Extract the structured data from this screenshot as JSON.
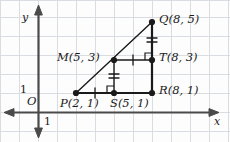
{
  "figure": {
    "colors": {
      "background": "#fdfdfd",
      "grid": "#d9dce0",
      "axis": "#4a4a4a",
      "segment": "#1a1a1a",
      "mark": "#1a1a1a",
      "label": "#1a1a1a"
    },
    "grid": {
      "spacing_px": 19,
      "origin_px": {
        "x": 38,
        "y": 112
      },
      "visible": true
    },
    "axes": {
      "x_label": "x",
      "y_label": "y",
      "origin_label": "O",
      "x_unit_label": "1",
      "y_unit_label": "1",
      "x_arrow_both_ends": true,
      "y_arrow_both_ends": true
    },
    "points": [
      {
        "name": "P",
        "label": "P(2, 1)",
        "x": 2,
        "y": 1,
        "px": 76,
        "py": 93,
        "label_px": 60,
        "label_py": 104
      },
      {
        "name": "S",
        "label": "S(5, 1)",
        "x": 5,
        "y": 1,
        "px": 114,
        "py": 93,
        "label_px": 110,
        "label_py": 104
      },
      {
        "name": "R",
        "label": "R(8, 1)",
        "x": 8,
        "y": 1,
        "px": 152,
        "py": 93,
        "label_px": 159,
        "label_py": 90
      },
      {
        "name": "M",
        "label": "M(5, 3)",
        "x": 5,
        "y": 3,
        "px": 114,
        "py": 60,
        "label_px": 57,
        "label_py": 57
      },
      {
        "name": "T",
        "label": "T(8, 3)",
        "x": 8,
        "y": 3,
        "px": 152,
        "py": 60,
        "label_px": 159,
        "label_py": 57
      },
      {
        "name": "Q",
        "label": "Q(8, 5)",
        "x": 8,
        "y": 5,
        "px": 152,
        "py": 22,
        "label_px": 159,
        "label_py": 19
      }
    ],
    "segments": [
      {
        "name": "PQ",
        "from": "P",
        "to": "Q",
        "style": "thin-hypotenuse"
      },
      {
        "name": "PR",
        "from": "P",
        "to": "R",
        "style": "thick"
      },
      {
        "name": "QR",
        "from": "Q",
        "to": "R",
        "style": "thick"
      },
      {
        "name": "MT",
        "from": "M",
        "to": "T",
        "style": "thin"
      },
      {
        "name": "MS",
        "from": "M",
        "to": "S",
        "style": "thin"
      }
    ],
    "tick_marks": [
      {
        "name": "PS-tick",
        "segment": "PS",
        "count": 1,
        "orientation": "vertical-stroke",
        "px": 95,
        "py": 93
      },
      {
        "name": "MT-tick",
        "segment": "MT",
        "count": 1,
        "orientation": "vertical-stroke",
        "px": 133,
        "py": 60
      },
      {
        "name": "MS-tick",
        "segment": "MS",
        "count": 2,
        "orientation": "horizontal-stroke",
        "px": 114,
        "py": 77
      },
      {
        "name": "QT-tick",
        "segment": "QT",
        "count": 2,
        "orientation": "horizontal-stroke",
        "px": 152,
        "py": 41
      }
    ],
    "right_angles": [
      {
        "name": "right-angle-at-S",
        "px": 114,
        "py": 93,
        "open_to": "up-left"
      },
      {
        "name": "right-angle-at-T",
        "px": 152,
        "py": 60,
        "open_to": "up-left"
      }
    ]
  }
}
